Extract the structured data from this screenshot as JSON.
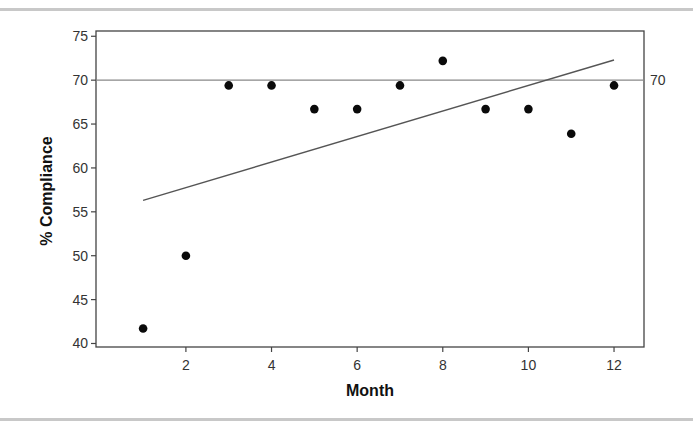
{
  "chart_data": {
    "type": "scatter",
    "title": "",
    "xlabel": "Month",
    "ylabel": "% Compliance",
    "x": [
      1,
      2,
      3,
      4,
      5,
      6,
      7,
      8,
      9,
      10,
      11,
      12
    ],
    "series": [
      {
        "name": "% Compliance",
        "values": [
          41.7,
          50.0,
          69.4,
          69.4,
          66.7,
          66.7,
          69.4,
          72.2,
          66.7,
          66.7,
          63.9,
          69.4
        ]
      }
    ],
    "trendline": {
      "x_start": 1,
      "y_start": 56.3,
      "x_end": 12,
      "y_end": 72.3
    },
    "reference_line": {
      "y": 70,
      "label": "70"
    },
    "xlim": [
      -0.1,
      12.7
    ],
    "ylim": [
      39.6,
      75.6
    ],
    "xticks": [
      2,
      4,
      6,
      8,
      10,
      12
    ],
    "xtick_labels": [
      "2",
      "4",
      "6",
      "8",
      "10",
      "12"
    ],
    "yticks": [
      40,
      45,
      50,
      55,
      60,
      65,
      70,
      75
    ],
    "ytick_labels": [
      "40",
      "45",
      "50",
      "55",
      "60",
      "65",
      "70",
      "75"
    ],
    "grid": false,
    "legend": null
  }
}
